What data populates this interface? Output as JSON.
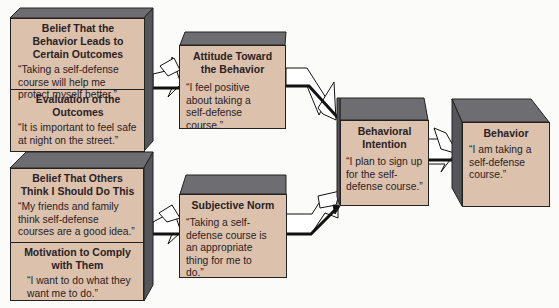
{
  "diagram": {
    "type": "theory-of-planned-behavior-flow",
    "colors": {
      "face": "#dcc1ac",
      "shade": "#6e6e72",
      "outline": "#222222",
      "background": "#fbfbf9"
    },
    "boxes": {
      "belief_outcomes_box": {
        "sections": [
          {
            "title": "Belief That the Behavior Leads to Certain Outcomes",
            "quote": "“Taking a self-defense course will help me protect myself better.”"
          },
          {
            "title": "Evaluation of the Outcomes",
            "quote": "“It is important to feel safe at night on the street.”"
          }
        ]
      },
      "belief_others_box": {
        "sections": [
          {
            "title": "Belief That Others Think I Should Do This",
            "quote": "“My friends and family think self-defense courses are a good idea.”"
          },
          {
            "title": "Motivation to Comply with Them",
            "quote": "“I want to do what they want me to do.”"
          }
        ]
      },
      "attitude_box": {
        "title": "Attitude Toward the Behavior",
        "quote": "“I feel positive about taking a self-defense course.”"
      },
      "subjective_norm_box": {
        "title": "Subjective Norm",
        "quote": "“Taking a self-defense course is an appropriate thing for me to do.”"
      },
      "intention_box": {
        "title": "Behavioral Intention",
        "quote": "“I plan to sign up for the self-defense course.”"
      },
      "behavior_box": {
        "title": "Behavior",
        "quote": "“I am taking a self-defense course.”"
      }
    },
    "arrows": [
      {
        "from": "belief_outcomes_box",
        "to": "attitude_box"
      },
      {
        "from": "belief_others_box",
        "to": "subjective_norm_box"
      },
      {
        "from": "attitude_box",
        "to": "intention_box"
      },
      {
        "from": "subjective_norm_box",
        "to": "intention_box"
      },
      {
        "from": "intention_box",
        "to": "behavior_box"
      }
    ]
  }
}
